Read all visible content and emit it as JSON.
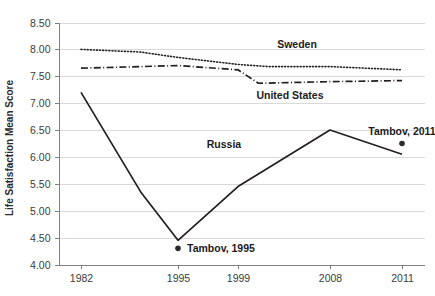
{
  "chart_data": {
    "type": "line",
    "title": "",
    "xlabel": "",
    "ylabel": "Life Satisfaction Mean Score",
    "x_tick_labels": [
      "1982",
      "1995",
      "1999",
      "2008",
      "2011"
    ],
    "y_tick_labels": [
      "4.00",
      "4.50",
      "5.00",
      "5.50",
      "6.00",
      "6.50",
      "7.00",
      "7.50",
      "8.00",
      "8.50"
    ],
    "ylim": [
      4.0,
      8.5
    ],
    "y_tick_step": 0.5,
    "grid": "horizontal",
    "legend": "inline-labels",
    "series": [
      {
        "name": "Sweden",
        "style": "dotted",
        "label_text": "Sweden",
        "x": [
          1982,
          1990,
          1995,
          1999,
          2002,
          2008,
          2011
        ],
        "values": [
          8.0,
          7.95,
          7.85,
          7.72,
          7.68,
          7.68,
          7.62
        ]
      },
      {
        "name": "United States",
        "style": "dash-dot",
        "label_text": "United States",
        "x": [
          1982,
          1990,
          1995,
          1999,
          2001,
          2008,
          2011
        ],
        "values": [
          7.65,
          7.68,
          7.7,
          7.62,
          7.37,
          7.4,
          7.42
        ]
      },
      {
        "name": "Russia",
        "style": "solid",
        "label_text": "Russia",
        "x": [
          1982,
          1990,
          1995,
          1999,
          2008,
          2011
        ],
        "values": [
          7.2,
          5.35,
          4.45,
          5.45,
          6.5,
          6.05
        ]
      }
    ],
    "annotations": [
      {
        "name": "tambov-1995",
        "label": "Tambov, 1995",
        "x": 1995,
        "value": 4.3,
        "marker": "dot"
      },
      {
        "name": "tambov-2011",
        "label": "Tambov, 2011",
        "x": 2011,
        "value": 6.25,
        "marker": "dot"
      }
    ],
    "colors": {
      "line": "#231f20",
      "grid": "#d9d9d9",
      "axis": "#808080",
      "text": "#231f20",
      "background": "#ffffff"
    }
  }
}
